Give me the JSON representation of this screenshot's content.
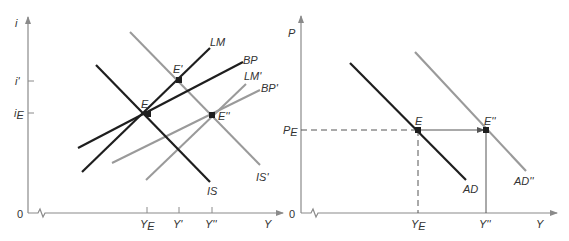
{
  "colors": {
    "dark": "#1e1e1e",
    "gray": "#9a9a9a",
    "axis": "#8a8a8a",
    "text": "#333333"
  },
  "left_panel": {
    "y_axis_label": "i",
    "x_axis_label": "Y",
    "origin_label": "0",
    "y_ticks": [
      {
        "label": "i'",
        "sub": ""
      },
      {
        "label": "i",
        "sub": "E"
      }
    ],
    "x_ticks": [
      {
        "label": "Y",
        "sub": "E"
      },
      {
        "label": "Y'",
        "sub": ""
      },
      {
        "label": "Y''",
        "sub": ""
      }
    ],
    "curves": {
      "IS": "IS",
      "IS_prime": "IS'",
      "LM": "LM",
      "LM_prime": "LM'",
      "BP": "BP",
      "BP_prime": "BP'"
    },
    "points": {
      "E": "E",
      "E_prime": "E'",
      "E_double_prime": "E''"
    }
  },
  "right_panel": {
    "y_axis_label": "P",
    "x_axis_label": "Y",
    "origin_label": "0",
    "y_ticks": [
      {
        "label": "P",
        "sub": "E"
      }
    ],
    "x_ticks": [
      {
        "label": "Y",
        "sub": "E"
      },
      {
        "label": "Y''",
        "sub": ""
      }
    ],
    "curves": {
      "AD": "AD",
      "AD_double_prime": "AD''"
    },
    "points": {
      "E": "E",
      "E_double_prime": "E''"
    }
  }
}
